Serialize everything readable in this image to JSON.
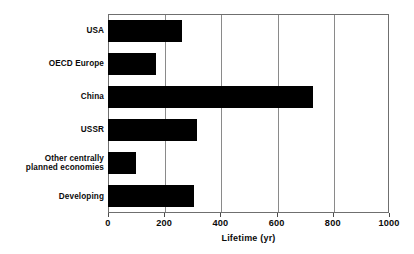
{
  "chart_data": {
    "type": "bar",
    "orientation": "horizontal",
    "title": "",
    "xlabel": "Lifetime (yr)",
    "ylabel": "",
    "xlim": [
      0,
      1000
    ],
    "xticks": [
      "0",
      "200",
      "400",
      "600",
      "800",
      "1000"
    ],
    "xtick_values": [
      0,
      200,
      400,
      600,
      800,
      1000
    ],
    "grid": true,
    "grid_axis": "x",
    "legend": false,
    "bar_color": "#000000",
    "categories": [
      "USA",
      "OECD  Europe",
      "China",
      "USSR",
      "Other centrally planned economies",
      "Developing"
    ],
    "category_lines": [
      [
        "USA"
      ],
      [
        "OECD  Europe"
      ],
      [
        "China"
      ],
      [
        "USSR"
      ],
      [
        "Other centrally",
        "planned economies"
      ],
      [
        "Developing"
      ]
    ],
    "values": [
      265,
      170,
      730,
      315,
      100,
      305
    ]
  }
}
